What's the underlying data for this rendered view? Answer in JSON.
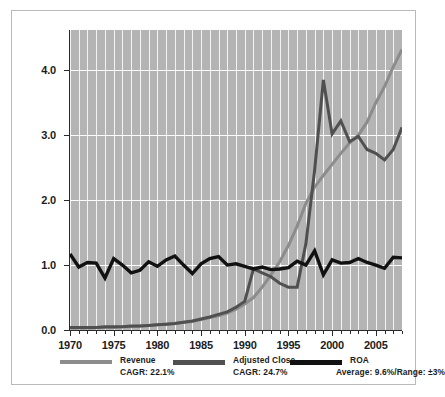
{
  "chart_data": {
    "type": "line",
    "title": "",
    "xlabel": "",
    "ylabel": "MAGNITUDE RELATIVE TO AVERAGE VALUE FOR THE PERIOD",
    "xlim": [
      1970,
      2008
    ],
    "ylim": [
      0.0,
      4.62
    ],
    "yticks": [
      "0.0",
      "1.0",
      "2.0",
      "3.0",
      "4.0"
    ],
    "ytick_values": [
      0.0,
      1.0,
      2.0,
      3.0,
      4.0
    ],
    "xticks": [
      "1970",
      "1975",
      "1980",
      "1985",
      "1990",
      "1995",
      "2000",
      "2005"
    ],
    "xtick_values": [
      1970,
      1975,
      1980,
      1985,
      1990,
      1995,
      2000,
      2005
    ],
    "grid": "white gridlines, vertical every year, horizontal at each major y tick",
    "plot_background": "#b4b4b4",
    "legend_position": "below axes",
    "x": [
      1970,
      1971,
      1972,
      1973,
      1974,
      1975,
      1976,
      1977,
      1978,
      1979,
      1980,
      1981,
      1982,
      1983,
      1984,
      1985,
      1986,
      1987,
      1988,
      1989,
      1990,
      1991,
      1992,
      1993,
      1994,
      1995,
      1996,
      1997,
      1998,
      1999,
      2000,
      2001,
      2002,
      2003,
      2004,
      2005,
      2006,
      2007,
      2008
    ],
    "series": [
      {
        "name": "Revenue",
        "color": "#8c8c8c",
        "cagr_label": "CAGR: 22.1%",
        "values": [
          0.03,
          0.03,
          0.03,
          0.04,
          0.04,
          0.04,
          0.05,
          0.05,
          0.06,
          0.07,
          0.08,
          0.09,
          0.1,
          0.12,
          0.13,
          0.16,
          0.19,
          0.22,
          0.26,
          0.32,
          0.4,
          0.5,
          0.66,
          0.85,
          1.05,
          1.3,
          1.6,
          1.95,
          2.2,
          2.38,
          2.55,
          2.72,
          2.88,
          3.0,
          3.2,
          3.5,
          3.75,
          4.05,
          4.32
        ]
      },
      {
        "name": "Adjusted Close",
        "color": "#505050",
        "cagr_label": "CAGR: 24.7%",
        "values": [
          0.04,
          0.04,
          0.04,
          0.04,
          0.05,
          0.05,
          0.05,
          0.06,
          0.06,
          0.07,
          0.08,
          0.09,
          0.1,
          0.12,
          0.14,
          0.17,
          0.2,
          0.24,
          0.28,
          0.35,
          0.44,
          0.94,
          0.88,
          0.82,
          0.72,
          0.66,
          0.66,
          1.33,
          2.46,
          3.85,
          3.02,
          3.22,
          2.9,
          2.98,
          2.78,
          2.72,
          2.62,
          2.78,
          3.12
        ]
      },
      {
        "name": "ROA",
        "color": "#111111",
        "stat_label": "Average: 9.6%/Range: ±3%",
        "values": [
          1.17,
          0.97,
          1.04,
          1.03,
          0.8,
          1.1,
          1.0,
          0.88,
          0.92,
          1.05,
          0.98,
          1.08,
          1.14,
          1.0,
          0.87,
          1.02,
          1.1,
          1.13,
          1.0,
          1.02,
          0.98,
          0.94,
          0.97,
          0.93,
          0.94,
          0.96,
          1.06,
          1.0,
          1.22,
          0.85,
          1.08,
          1.03,
          1.04,
          1.1,
          1.04,
          1.0,
          0.95,
          1.12,
          1.11
        ]
      }
    ]
  },
  "axis": {
    "y_label_text": "MAGNITUDE RELATIVE TO AVERAGE VALUE FOR THE PERIOD"
  },
  "legend": {
    "items": [
      {
        "name": "Revenue",
        "sub": "CAGR: 22.1%",
        "color": "#8c8c8c"
      },
      {
        "name": "Adjusted Close",
        "sub": "CAGR: 24.7%",
        "color": "#505050"
      },
      {
        "name": "ROA",
        "sub": "Average: 9.6%/Range: ±3%",
        "color": "#111111"
      }
    ]
  }
}
